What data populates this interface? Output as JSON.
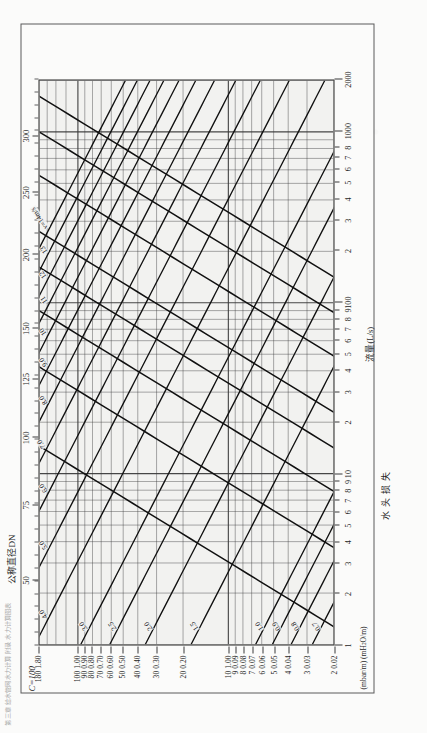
{
  "page": {
    "running_header": "第三章 给水管网水力计算  附录 水力计算图表",
    "orientation": "rotated-90-ccw"
  },
  "figure": {
    "coefficient_label": "C=100",
    "top_axis_caption": "公称直径DN",
    "bottom_axis_caption": "流量(L/s)",
    "left_axis_caption": "水头损失",
    "left_axis_units": "(mbar/m) (mH₂O/m)"
  },
  "chart_data": {
    "type": "line",
    "subtitle": "公称直径DN / 流量(L/s) / 水头损失 (mbar/m) (mH₂O/m)",
    "xlabel": "流量(L/s)",
    "ylabel": "水头损失 (mbar/m) (mH₂O/m)",
    "xscale": "log",
    "yscale": "log",
    "grid": true,
    "legend": "none",
    "xlim": [
      1,
      2000
    ],
    "ylim": [
      0.02,
      1.8
    ],
    "x_ticks": [
      {
        "value": 1,
        "label": "1"
      },
      {
        "value": 2,
        "label": "2"
      },
      {
        "value": 3,
        "label": "3"
      },
      {
        "value": 4,
        "label": "4"
      },
      {
        "value": 5,
        "label": "5"
      },
      {
        "value": 6,
        "label": "6"
      },
      {
        "value": 7,
        "label": "7"
      },
      {
        "value": 8,
        "label": "8"
      },
      {
        "value": 9,
        "label": "9"
      },
      {
        "value": 10,
        "label": "10"
      },
      {
        "value": 20,
        "label": "2"
      },
      {
        "value": 30,
        "label": "3"
      },
      {
        "value": 40,
        "label": "4"
      },
      {
        "value": 50,
        "label": "5"
      },
      {
        "value": 60,
        "label": "6"
      },
      {
        "value": 70,
        "label": "7"
      },
      {
        "value": 80,
        "label": "8"
      },
      {
        "value": 90,
        "label": "9"
      },
      {
        "value": 100,
        "label": "100"
      },
      {
        "value": 200,
        "label": "2"
      },
      {
        "value": 300,
        "label": "3"
      },
      {
        "value": 400,
        "label": "4"
      },
      {
        "value": 500,
        "label": "5"
      },
      {
        "value": 600,
        "label": "6"
      },
      {
        "value": 700,
        "label": "7"
      },
      {
        "value": 800,
        "label": "8"
      },
      {
        "value": 1000,
        "label": "1000"
      },
      {
        "value": 2000,
        "label": "2000"
      }
    ],
    "y_ticks": [
      {
        "value": 1.8,
        "label": "180 1.80"
      },
      {
        "value": 1.0,
        "label": "100 1.00"
      },
      {
        "value": 0.9,
        "label": "90 0.90"
      },
      {
        "value": 0.8,
        "label": "80 0.80"
      },
      {
        "value": 0.7,
        "label": "70 0.70"
      },
      {
        "value": 0.6,
        "label": "60 0.60"
      },
      {
        "value": 0.5,
        "label": "50 0.50"
      },
      {
        "value": 0.4,
        "label": "40 0.40"
      },
      {
        "value": 0.3,
        "label": "30 0.30"
      },
      {
        "value": 0.2,
        "label": "20 0.20"
      },
      {
        "value": 0.1,
        "label": "10 1.00"
      },
      {
        "value": 0.09,
        "label": "9 0.09"
      },
      {
        "value": 0.08,
        "label": "8 0.08"
      },
      {
        "value": 0.07,
        "label": "7 0.07"
      },
      {
        "value": 0.06,
        "label": "6 0.06"
      },
      {
        "value": 0.05,
        "label": "5 0.05"
      },
      {
        "value": 0.04,
        "label": "4 0.04"
      },
      {
        "value": 0.03,
        "label": "3 0.03"
      },
      {
        "value": 0.02,
        "label": "2 0.02"
      }
    ],
    "dn_axis": {
      "caption": "公称直径DN",
      "ticks": [
        {
          "label": "50",
          "pos": 0.115
        },
        {
          "label": "75",
          "pos": 0.248
        },
        {
          "label": "100",
          "pos": 0.367
        },
        {
          "label": "125",
          "pos": 0.47
        },
        {
          "label": "150",
          "pos": 0.56
        },
        {
          "label": "200",
          "pos": 0.69
        },
        {
          "label": "250",
          "pos": 0.8
        },
        {
          "label": "300",
          "pos": 0.9
        }
      ]
    },
    "diameter_series": {
      "name": "公称直径DN (mm)",
      "note": "steep lines rising left→right; each line is one nominal pipe diameter",
      "values": [
        50,
        75,
        100,
        125,
        150,
        200,
        250,
        300
      ]
    },
    "velocity_series": {
      "name": "流速 v (m/s)",
      "note": "shallower lines falling left→right; labelled along the line",
      "labels": [
        "v=14m/s",
        "13",
        "12",
        "11",
        "10",
        "9.0",
        "8.0",
        "7.0",
        "6.0",
        "5.0",
        "4.0",
        "3.0",
        "2.5",
        "2.0",
        "1.5",
        "1.0",
        "0.9",
        "0.8",
        "0.7",
        "0.6",
        "0.5"
      ],
      "values": [
        14,
        13,
        12,
        11,
        10,
        9.0,
        8.0,
        7.0,
        6.0,
        5.0,
        4.0,
        3.0,
        2.5,
        2.0,
        1.5,
        1.0,
        0.9,
        0.8,
        0.7,
        0.6,
        0.5
      ]
    }
  }
}
